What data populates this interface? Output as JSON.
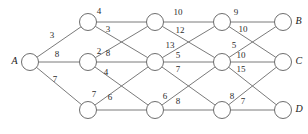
{
  "diagram": {
    "type": "layered-network",
    "stroke_color": "#6b6b6b",
    "node_fill": "#ffffff",
    "label_color": "#2b2b2b",
    "nodes": [
      {
        "id": "A",
        "label": "A",
        "x": 30,
        "y": 62,
        "r": 8.5,
        "label_side": "left",
        "column": 0
      },
      {
        "id": "n1",
        "label": "",
        "x": 88,
        "y": 22,
        "r": 8.5,
        "label_side": "none",
        "column": 1
      },
      {
        "id": "n2",
        "label": "",
        "x": 88,
        "y": 62,
        "r": 8.5,
        "label_side": "none",
        "column": 1
      },
      {
        "id": "n3",
        "label": "",
        "x": 88,
        "y": 110,
        "r": 8.5,
        "label_side": "none",
        "column": 1
      },
      {
        "id": "n4",
        "label": "",
        "x": 155,
        "y": 22,
        "r": 8.5,
        "label_side": "none",
        "column": 2
      },
      {
        "id": "n5",
        "label": "",
        "x": 155,
        "y": 62,
        "r": 8.5,
        "label_side": "none",
        "column": 2
      },
      {
        "id": "n6",
        "label": "",
        "x": 155,
        "y": 110,
        "r": 8.5,
        "label_side": "none",
        "column": 2
      },
      {
        "id": "n7",
        "label": "",
        "x": 222,
        "y": 22,
        "r": 8.5,
        "label_side": "none",
        "column": 3
      },
      {
        "id": "n8",
        "label": "",
        "x": 222,
        "y": 62,
        "r": 8.5,
        "label_side": "none",
        "column": 3
      },
      {
        "id": "n9",
        "label": "",
        "x": 222,
        "y": 110,
        "r": 8.5,
        "label_side": "none",
        "column": 3
      },
      {
        "id": "B",
        "label": "B",
        "x": 283,
        "y": 22,
        "r": 8.5,
        "label_side": "right",
        "column": 4
      },
      {
        "id": "C",
        "label": "C",
        "x": 283,
        "y": 62,
        "r": 8.5,
        "label_side": "right",
        "column": 4
      },
      {
        "id": "D",
        "label": "D",
        "x": 283,
        "y": 110,
        "r": 8.5,
        "label_side": "right",
        "column": 4
      }
    ],
    "edges": [
      {
        "from": "A",
        "to": "n1",
        "weight": "3",
        "lx": 52,
        "ly": 36
      },
      {
        "from": "A",
        "to": "n2",
        "weight": "8",
        "lx": 57,
        "ly": 55
      },
      {
        "from": "A",
        "to": "n3",
        "weight": "7",
        "lx": 55,
        "ly": 80
      },
      {
        "from": "n1",
        "to": "n4",
        "weight": "4",
        "lx": 99,
        "ly": 12
      },
      {
        "from": "n1",
        "to": "n5",
        "weight": "3",
        "lx": 108,
        "ly": 30
      },
      {
        "from": "n2",
        "to": "n4",
        "weight": "8",
        "lx": 108,
        "ly": 54
      },
      {
        "from": "n2",
        "to": "n5",
        "weight": "2",
        "lx": 99,
        "ly": 52
      },
      {
        "from": "n2",
        "to": "n6",
        "weight": "4",
        "lx": 106,
        "ly": 73
      },
      {
        "from": "n3",
        "to": "n5",
        "weight": "6",
        "lx": 110,
        "ly": 98
      },
      {
        "from": "n3",
        "to": "n6",
        "weight": "7",
        "lx": 94,
        "ly": 95
      },
      {
        "from": "n4",
        "to": "n7",
        "weight": "10",
        "lx": 178,
        "ly": 13
      },
      {
        "from": "n4",
        "to": "n8",
        "weight": "12",
        "lx": 180,
        "ly": 31
      },
      {
        "from": "n5",
        "to": "n7",
        "weight": "13",
        "lx": 170,
        "ly": 46
      },
      {
        "from": "n5",
        "to": "n8",
        "weight": "5",
        "lx": 178,
        "ly": 56
      },
      {
        "from": "n5",
        "to": "n9",
        "weight": "7",
        "lx": 178,
        "ly": 70
      },
      {
        "from": "n6",
        "to": "n8",
        "weight": "6",
        "lx": 165,
        "ly": 97
      },
      {
        "from": "n6",
        "to": "n9",
        "weight": "8",
        "lx": 178,
        "ly": 102
      },
      {
        "from": "n7",
        "to": "B",
        "weight": "9",
        "lx": 236,
        "ly": 13
      },
      {
        "from": "n7",
        "to": "C",
        "weight": "10",
        "lx": 243,
        "ly": 30
      },
      {
        "from": "n8",
        "to": "B",
        "weight": "5",
        "lx": 234,
        "ly": 46
      },
      {
        "from": "n8",
        "to": "C",
        "weight": "10",
        "lx": 241,
        "ly": 56
      },
      {
        "from": "n8",
        "to": "D",
        "weight": "15",
        "lx": 241,
        "ly": 70
      },
      {
        "from": "n9",
        "to": "C",
        "weight": "8",
        "lx": 232,
        "ly": 97
      },
      {
        "from": "n9",
        "to": "D",
        "weight": "7",
        "lx": 243,
        "ly": 102
      }
    ]
  }
}
